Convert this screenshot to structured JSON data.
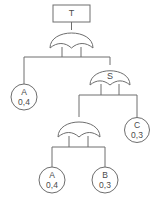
{
  "diagram": {
    "type": "fault-tree",
    "title_node": {
      "label": "T",
      "shape": "rectangle"
    },
    "gates": [
      {
        "id": "gate-top",
        "label": "",
        "type": "OR",
        "cx": 72,
        "cy": 40
      },
      {
        "id": "gate-s",
        "label": "S",
        "type": "OR",
        "cx": 110,
        "cy": 77
      },
      {
        "id": "gate-lower",
        "label": "",
        "type": "OR",
        "cx": 79,
        "cy": 129
      }
    ],
    "basic_events": [
      {
        "id": "event-a-left",
        "name": "A",
        "value": "0,4",
        "cx": 24,
        "cy": 97
      },
      {
        "id": "event-c",
        "name": "C",
        "value": "0,3",
        "cx": 137,
        "cy": 130
      },
      {
        "id": "event-a-bottom",
        "name": "A",
        "value": "0,4",
        "cx": 52,
        "cy": 180
      },
      {
        "id": "event-b",
        "name": "B",
        "value": "0,3",
        "cx": 105,
        "cy": 180
      }
    ],
    "colors": {
      "stroke": "#6e6e6e",
      "text": "#4a4a4a",
      "background": "#ffffff"
    }
  }
}
